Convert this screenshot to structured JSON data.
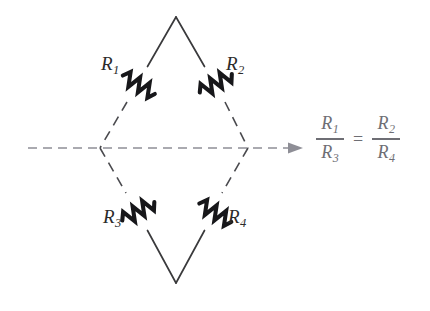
{
  "figure": {
    "name": "wheatstone-bridge-balance-diagram",
    "background_color": "#ffffff",
    "line_color": "#3a3a3c",
    "dashed_line_color": "#8e8e96",
    "axis_arrow_color": "#8e8e96",
    "equation_color": "#6e6e74"
  },
  "circuit": {
    "shape": "diamond",
    "vertices": {
      "top": {
        "x": 176,
        "y": 17
      },
      "left": {
        "x": 100,
        "y": 148
      },
      "right": {
        "x": 248,
        "y": 148
      },
      "bottom": {
        "x": 176,
        "y": 283
      }
    },
    "resistors": [
      {
        "id": "r1",
        "label": "R",
        "subscript": "1",
        "edge": "top-left",
        "label_side": "left"
      },
      {
        "id": "r2",
        "label": "R",
        "subscript": "2",
        "edge": "top-right",
        "label_side": "right"
      },
      {
        "id": "r3",
        "label": "R",
        "subscript": "3",
        "edge": "bottom-left",
        "label_side": "left"
      },
      {
        "id": "r4",
        "label": "R",
        "subscript": "4",
        "edge": "bottom-right",
        "label_side": "right"
      }
    ]
  },
  "symmetry_axis": {
    "style": "dashed",
    "start_x": 28,
    "end_x": 302,
    "y": 148,
    "has_arrowhead": true,
    "arrow_direction": "right"
  },
  "equation": {
    "left_fraction": {
      "numerator": "R",
      "numerator_subscript": "1",
      "denominator": "R",
      "denominator_subscript": "3"
    },
    "operator": "=",
    "right_fraction": {
      "numerator": "R",
      "numerator_subscript": "2",
      "denominator": "R",
      "denominator_subscript": "4"
    }
  }
}
